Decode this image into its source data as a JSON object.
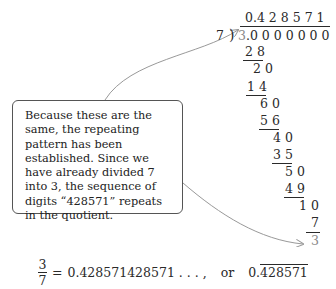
{
  "division": {
    "divisor": "7",
    "dividend": "3.0 0 0 0 0 0 0",
    "dividend_first": "3",
    "dividend_rest": ".0 0 0 0 0 0 0",
    "quotient": "0.4 2 8 5 7 1",
    "steps": [
      {
        "text": "2 8",
        "type": "subtract"
      },
      {
        "text": "2 0",
        "type": "remainder"
      },
      {
        "text": "1 4",
        "type": "subtract"
      },
      {
        "text": "6 0",
        "type": "remainder"
      },
      {
        "text": "5 6",
        "type": "subtract"
      },
      {
        "text": "4 0",
        "type": "remainder"
      },
      {
        "text": "3 5",
        "type": "subtract"
      },
      {
        "text": "5 0",
        "type": "remainder"
      },
      {
        "text": "4 9",
        "type": "subtract"
      },
      {
        "text": "1 0",
        "type": "remainder"
      },
      {
        "text": "7",
        "type": "subtract"
      },
      {
        "text": "3",
        "type": "final-remainder"
      }
    ]
  },
  "callout": {
    "text": "Because these are the same, the repeating pattern has been established. Since we have already divided 7 into 3, the sequence of digits “428571” repeats in the quotient."
  },
  "equation": {
    "numerator": "3",
    "denominator": "7",
    "equals": "=",
    "expansion": "0.428571428571 . . . ,",
    "or": "or",
    "repeating_prefix": "0.",
    "repeating_block": "428571"
  },
  "colors": {
    "text": "#2a2a2a",
    "highlight_gray": "#8a8a8a",
    "arrow": "#999999"
  }
}
